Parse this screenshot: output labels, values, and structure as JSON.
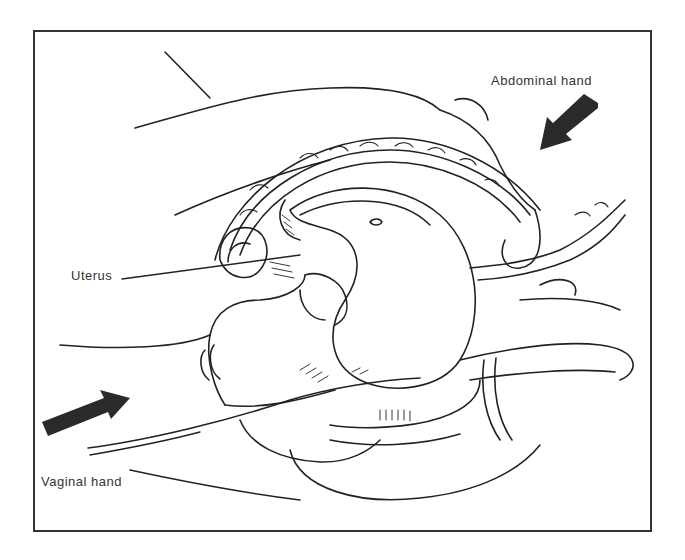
{
  "diagram": {
    "labels": {
      "abdominal_hand": "Abdominal hand",
      "uterus": "Uterus",
      "vaginal_hand": "Vaginal hand"
    },
    "colors": {
      "line": "#222222",
      "arrow": "#2a2a2a",
      "border": "#333333"
    }
  }
}
